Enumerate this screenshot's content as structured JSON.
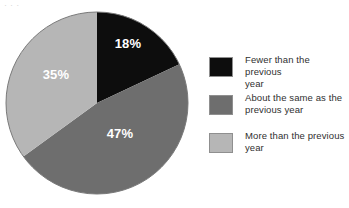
{
  "figure": {
    "name": "pie-chart-figure",
    "caption_remnant": "·            ·                ·",
    "background_color": "#ffffff"
  },
  "chart_data": {
    "type": "pie",
    "title": "",
    "subtitle": "",
    "xlabel": "",
    "ylabel": "",
    "grid": false,
    "legend_position": "right",
    "start_angle_deg": 0,
    "direction": "clockwise",
    "categories": [
      "Fewer than the previous year",
      "About the same as the previous year",
      "More than the previous year"
    ],
    "values": [
      18,
      47,
      35
    ],
    "value_unit": "%",
    "data_labels": [
      "18%",
      "47%",
      "35%"
    ],
    "colors": [
      "#0d0d0d",
      "#6e6e6e",
      "#b6b6b6"
    ],
    "label_color": "#ffffff",
    "slices": [
      {
        "label": "Fewer than the previous year",
        "value": 18,
        "display": "18%",
        "color": "#0d0d0d",
        "start_deg": 0,
        "end_deg": 64.8,
        "label_x": 128,
        "label_y": 48
      },
      {
        "label": "About the same as the previous year",
        "value": 47,
        "display": "47%",
        "color": "#6e6e6e",
        "start_deg": 64.8,
        "end_deg": 234.0,
        "label_x": 120,
        "label_y": 138
      },
      {
        "label": "More than the previous year",
        "value": 35,
        "display": "35%",
        "color": "#b6b6b6",
        "start_deg": 234.0,
        "end_deg": 360.0,
        "label_x": 56,
        "label_y": 79
      }
    ],
    "geometry": {
      "center_x": 93,
      "center_y": 93,
      "radius": 91,
      "outline_color": "#7a7a7a"
    }
  },
  "legend": {
    "name": "chart-legend",
    "items": [
      {
        "swatch_color": "#0d0d0d",
        "line1": "Fewer than the previous",
        "line2": "year"
      },
      {
        "swatch_color": "#6e6e6e",
        "line1": "About the same as the",
        "line2": "previous year"
      },
      {
        "swatch_color": "#b6b6b6",
        "line1": "More than the previous",
        "line2": "year"
      }
    ]
  }
}
